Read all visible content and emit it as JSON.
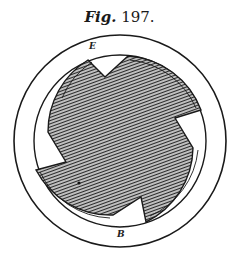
{
  "caption": {
    "prefix": "Fig.",
    "number": "197."
  },
  "labels": {
    "top": "E",
    "bottom": "B"
  },
  "figure": {
    "stroke_color": "#1a1a1a",
    "hatch_color": "#2a2a2a",
    "background": "#ffffff"
  }
}
